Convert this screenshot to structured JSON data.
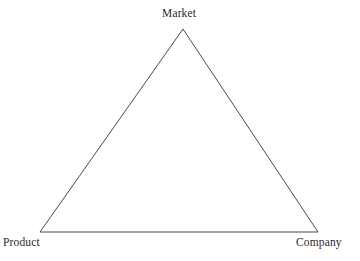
{
  "figure": {
    "type": "triangle-diagram",
    "background_color": "#ffffff",
    "stroke_color": "#4a4a4a",
    "text_color": "#2b2b2b",
    "vertices": {
      "top": {
        "label": "Market",
        "x": 183,
        "y": 29
      },
      "bottom_left": {
        "label": "Product",
        "x": 40,
        "y": 232
      },
      "bottom_right": {
        "label": "Company",
        "x": 318,
        "y": 232
      }
    },
    "labels": {
      "top": "Market",
      "bottom_left": "Product",
      "bottom_right": "Company"
    }
  }
}
